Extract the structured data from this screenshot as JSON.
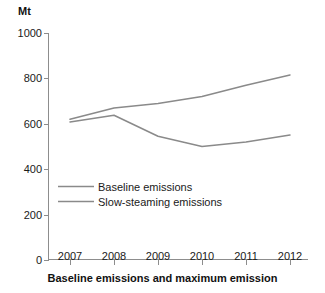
{
  "unit_label": "Mt",
  "caption": "Baseline emissions and maximum emission",
  "legend": {
    "items": [
      {
        "label": "Baseline emissions",
        "color": "#8a8a8a"
      },
      {
        "label": "Slow-steaming emissions",
        "color": "#8a8a8a"
      }
    ]
  },
  "axes": {
    "y_ticks": [
      "0",
      "200",
      "400",
      "600",
      "800",
      "1000"
    ],
    "x_ticks": [
      "2007",
      "2008",
      "2009",
      "2010",
      "2011",
      "2012"
    ]
  },
  "chart_data": {
    "type": "line",
    "title": "Baseline emissions and maximum emission",
    "xlabel": "",
    "ylabel": "Mt",
    "categories": [
      "2007",
      "2008",
      "2009",
      "2010",
      "2011",
      "2012"
    ],
    "x": [
      2007,
      2008,
      2009,
      2010,
      2011,
      2012
    ],
    "series": [
      {
        "name": "Baseline emissions",
        "color": "#8a8a8a",
        "values": [
          620,
          670,
          690,
          720,
          770,
          815
        ]
      },
      {
        "name": "Slow-steaming emissions",
        "color": "#8a8a8a",
        "values": [
          608,
          638,
          545,
          500,
          520,
          550
        ]
      }
    ],
    "ylim": [
      0,
      1000
    ],
    "yticks": [
      0,
      200,
      400,
      600,
      800,
      1000
    ],
    "xlim": [
      2007,
      2012
    ],
    "grid": false,
    "legend_position": "inside-lower-left"
  }
}
